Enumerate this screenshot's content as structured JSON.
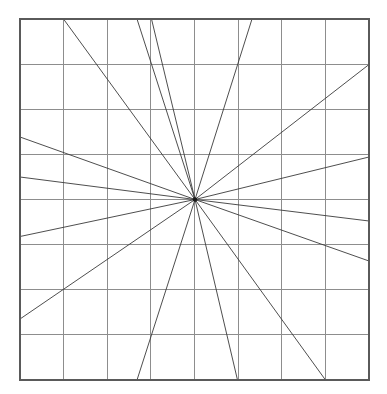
{
  "figure": {
    "background_color": "#ffffff",
    "frame": {
      "x": 20,
      "y": 19,
      "width": 349,
      "height": 361,
      "stroke_color": "#5a5a5a",
      "stroke_width": 1.6
    },
    "grid": {
      "columns": 8,
      "rows": 8,
      "cell_width": 43.6,
      "cell_height": 45.1,
      "stroke_color": "#8d8d8d",
      "stroke_width": 1,
      "x_positions": [
        20,
        63.6,
        107.3,
        150.9,
        194.5,
        238.1,
        281.8,
        325.4,
        369
      ],
      "y_positions": [
        19,
        64.1,
        109.3,
        154.4,
        199.5,
        244.6,
        289.8,
        334.9,
        380
      ]
    },
    "center": {
      "x": 195,
      "y": 199.5,
      "label": "common intersection point",
      "dot_radius": 2.2,
      "dot_color": "#1a1a1a"
    },
    "rays": [
      {
        "name": "ray-top-left-steep",
        "x1": 195,
        "y1": 199.5,
        "x2": 63.5,
        "y2": 19,
        "edge": "top"
      },
      {
        "name": "ray-top-mid-left",
        "x1": 195,
        "y1": 199.5,
        "x2": 151.5,
        "y2": 19,
        "edge": "top"
      },
      {
        "name": "ray-top-near-center",
        "x1": 195,
        "y1": 199.5,
        "x2": 137.0,
        "y2": 19,
        "edge": "top"
      },
      {
        "name": "ray-top-right-steep",
        "x1": 195,
        "y1": 199.5,
        "x2": 252.0,
        "y2": 19,
        "edge": "top"
      },
      {
        "name": "ray-right-upper",
        "x1": 195,
        "y1": 199.5,
        "x2": 369,
        "y2": 64.5,
        "edge": "right"
      },
      {
        "name": "ray-right-mid-upper",
        "x1": 195,
        "y1": 199.5,
        "x2": 369,
        "y2": 157.0,
        "edge": "right"
      },
      {
        "name": "ray-right-lower",
        "x1": 195,
        "y1": 199.5,
        "x2": 369,
        "y2": 221.0,
        "edge": "right"
      },
      {
        "name": "ray-right-bottom",
        "x1": 195,
        "y1": 199.5,
        "x2": 369,
        "y2": 261.0,
        "edge": "right"
      },
      {
        "name": "ray-bottom-left",
        "x1": 195,
        "y1": 199.5,
        "x2": 137.0,
        "y2": 380,
        "edge": "bottom"
      },
      {
        "name": "ray-bottom-mid",
        "x1": 195,
        "y1": 199.5,
        "x2": 237.5,
        "y2": 380,
        "edge": "bottom"
      },
      {
        "name": "ray-bottom-right",
        "x1": 195,
        "y1": 199.5,
        "x2": 325.5,
        "y2": 380,
        "edge": "bottom"
      },
      {
        "name": "ray-left-upper",
        "x1": 195,
        "y1": 199.5,
        "x2": 20,
        "y2": 137.0,
        "edge": "left"
      },
      {
        "name": "ray-left-mid",
        "x1": 195,
        "y1": 199.5,
        "x2": 20,
        "y2": 236.5,
        "edge": "left"
      },
      {
        "name": "ray-left-lower",
        "x1": 195,
        "y1": 199.5,
        "x2": 20,
        "y2": 319.0,
        "edge": "left"
      },
      {
        "name": "ray-left-slight",
        "x1": 195,
        "y1": 199.5,
        "x2": 20,
        "y2": 177.0,
        "edge": "left"
      }
    ],
    "stats": {
      "ray_count": "15",
      "grid_cells": "64",
      "line_color": "#3a3a3a"
    }
  }
}
